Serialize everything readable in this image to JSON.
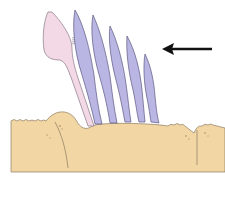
{
  "diagram": {
    "type": "biological-illustration",
    "colors": {
      "background": "#ffffff",
      "tissue": "#f2d7a4",
      "tissue_outline": "#7a6a55",
      "pink_cell": "#f3d9e6",
      "pink_cell_outline": "#8a7a88",
      "blue_cells": "#b9b6e3",
      "blue_cells_outline": "#5c5880",
      "arrow": "#111111"
    },
    "elements": {
      "pink_cell": {
        "label": ""
      },
      "blue_cells": {
        "count": 5
      },
      "arrow": {
        "direction": "left"
      }
    }
  }
}
